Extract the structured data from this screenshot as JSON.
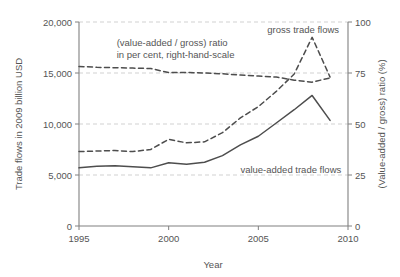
{
  "chart_data": {
    "type": "line",
    "title": "",
    "xlabel": "Year",
    "ylabel": "Trade flows in 2009 billion USD",
    "y2label": "(Value-added / gross) ratio (%)",
    "xlim": [
      1995,
      2010
    ],
    "ylim": [
      0,
      20000
    ],
    "y2lim": [
      0,
      100
    ],
    "xticks": [
      1995,
      2000,
      2005,
      2010
    ],
    "xticklabels": [
      "1995",
      "2000",
      "2005",
      "2010"
    ],
    "yticks": [
      0,
      5000,
      10000,
      15000,
      20000
    ],
    "yticklabels": [
      "0",
      "5,000",
      "10,000",
      "15,000",
      "20,000"
    ],
    "y2ticks": [
      0,
      25,
      50,
      75,
      100
    ],
    "y2ticklabels": [
      "0",
      "25",
      "50",
      "75",
      "100"
    ],
    "grid": true,
    "grid_axis": "y",
    "legend_position": "inline-annotations",
    "x": [
      1995,
      1996,
      1997,
      1998,
      1999,
      2000,
      2001,
      2002,
      2003,
      2004,
      2005,
      2006,
      2007,
      2008,
      2009
    ],
    "series": [
      {
        "name": "gross trade flows",
        "axis": "left",
        "style": "dashed",
        "color": "#4d4d4d",
        "values": [
          7300,
          7350,
          7400,
          7300,
          7500,
          8500,
          8150,
          8250,
          9150,
          10600,
          11700,
          13200,
          14900,
          18500,
          14600
        ]
      },
      {
        "name": "value-added trade flows",
        "axis": "left",
        "style": "solid",
        "color": "#4d4d4d",
        "values": [
          5700,
          5850,
          5900,
          5800,
          5700,
          6200,
          6050,
          6250,
          6900,
          7950,
          8800,
          10100,
          11400,
          12800,
          10350
        ]
      },
      {
        "name": "(value-added / gross) ratio",
        "axis": "right",
        "style": "dashed",
        "color": "#4d4d4d",
        "values": [
          78.2,
          77.8,
          77.6,
          77.4,
          77.2,
          75.2,
          75.3,
          75.0,
          74.6,
          74.0,
          73.5,
          73.0,
          71.5,
          70.5,
          72.6
        ]
      }
    ],
    "annotations": [
      {
        "name": "ratio-annotation",
        "lines": [
          "(value-added / gross) ratio",
          "in per cent, right-hand-scale"
        ],
        "x": 1997.1,
        "y_px": 46
      },
      {
        "name": "gross-annotation",
        "lines": [
          "gross trade flows"
        ],
        "x": 2005.5,
        "y_px": 33
      },
      {
        "name": "value-added-annotation",
        "lines": [
          "value-added trade flows"
        ],
        "x": 2004.0,
        "y_px": 173
      }
    ]
  },
  "axes": {
    "left_axis_label": "Trade flows in 2009 billion USD",
    "right_axis_label": "(Value-added / gross) ratio (%)",
    "x_axis_label": "Year"
  },
  "colors": {
    "line": "#4d4d4d",
    "grid": "#cccccc",
    "axis": "#808080",
    "text": "#555555",
    "background": "#ffffff"
  }
}
